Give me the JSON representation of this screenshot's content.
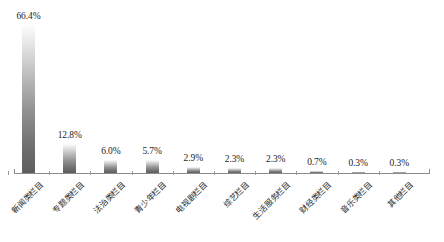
{
  "chart_data": {
    "type": "bar",
    "title": "",
    "subtitle": "",
    "xlabel": "",
    "ylabel": "",
    "ylim": [
      0,
      70
    ],
    "grid": false,
    "legend": false,
    "value_suffix": "%",
    "categories": [
      "新闻类栏目",
      "专题类栏目",
      "法治类栏目",
      "青少年栏目",
      "电视剧栏目",
      "综艺栏目",
      "生活服务栏目",
      "财经类栏目",
      "音乐类栏目",
      "其他栏目"
    ],
    "values": [
      66.4,
      12.8,
      6.0,
      5.7,
      2.9,
      2.3,
      2.3,
      0.7,
      0.3,
      0.3
    ],
    "value_labels": [
      "66.4%",
      "12.8%",
      "6.0%",
      "5.7%",
      "2.9%",
      "2.3%",
      "2.3%",
      "0.7%",
      "0.3%",
      "0.3%"
    ],
    "bar_gradient": {
      "top": "#fdfdfd",
      "bottom": "#5e5e5e"
    },
    "axis_color": "#8c8c8c",
    "text_color": "#1c1c1c",
    "background": "#ffffff"
  }
}
